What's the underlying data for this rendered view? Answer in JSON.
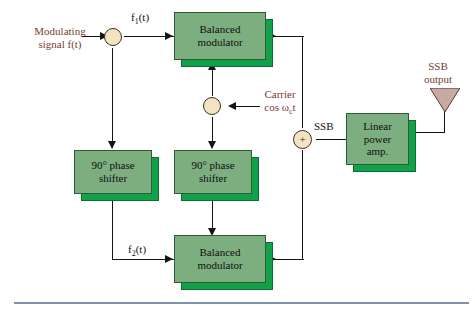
{
  "diagram": {
    "colors": {
      "block_face": "#7cae80",
      "block_extrusion": "#13a04a",
      "node_fill": "#f3e3c3",
      "label_red": "#7a3b34",
      "line": "#141414",
      "antenna": "#c9a9a2",
      "rule": "#7d93ab"
    },
    "labels": {
      "modulating_signal_line1": "Modulating",
      "modulating_signal_line2": "signal f(t)",
      "f1": "f",
      "f1_sub": "1",
      "f1_tail": "(t)",
      "f2": "f",
      "f2_sub": "2",
      "f2_tail": "(t)",
      "carrier_line1": "Carrier",
      "carrier_line2_pre": "cos ",
      "carrier_line2_omega": "ω",
      "carrier_line2_sub": "c",
      "carrier_line2_post": "t",
      "ssb": "SSB",
      "ssb_output_line1": "SSB",
      "ssb_output_line2": "output",
      "summer_symbol": "+"
    },
    "blocks": [
      {
        "id": "balanced-modulator-top",
        "line1": "Balanced",
        "line2": "modulator"
      },
      {
        "id": "phase-shifter-left",
        "line1": "90° phase",
        "line2": "shifter"
      },
      {
        "id": "phase-shifter-right",
        "line1": "90° phase",
        "line2": "shifter"
      },
      {
        "id": "balanced-modulator-bottom",
        "line1": "Balanced",
        "line2": "modulator"
      },
      {
        "id": "linear-power-amp",
        "line1": "Linear",
        "line2": "power",
        "line3": "amp."
      }
    ]
  }
}
